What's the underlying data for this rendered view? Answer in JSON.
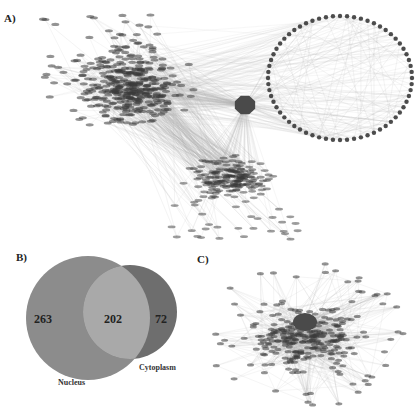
{
  "panels": {
    "a": {
      "label": "A)",
      "description": "Protein interaction network with dense left cluster, central hub node and circular ring of nodes"
    },
    "b": {
      "label": "B)",
      "description": "Venn diagram of subcellular localization"
    },
    "c": {
      "label": "C)",
      "description": "Dense protein interaction network with central hub node"
    }
  },
  "venn": {
    "sets": [
      {
        "name": "Nucleus",
        "only": "263",
        "color": "#8c8c8c"
      },
      {
        "name": "Cytoplasm",
        "only": "72",
        "color": "#6e6e6e"
      }
    ],
    "intersection": "202",
    "intersection_color": "#a9a9a9"
  },
  "colors": {
    "node": "#3a3a3a",
    "hub": "#4a4a4a",
    "edge": "#b8b8b8",
    "background": "#ffffff"
  }
}
